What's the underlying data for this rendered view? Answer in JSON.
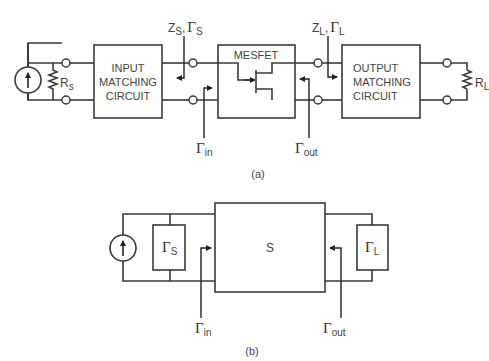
{
  "figure_a": {
    "caption": "(a)",
    "input_block": {
      "line1": "INPUT",
      "line2": "MATCHING",
      "line3": "CIRCUIT"
    },
    "device_block": {
      "label": "MESFET"
    },
    "output_block": {
      "line1": "OUTPUT",
      "line2": "MATCHING",
      "line3": "CIRCUIT"
    },
    "source_resistor": {
      "symbol": "R",
      "sub": "s"
    },
    "load_resistor": {
      "symbol": "R",
      "sub": "L"
    },
    "source_impedance_label": {
      "z": "Z",
      "z_sub": "S",
      "sep": ",",
      "gamma": "Γ",
      "gamma_sub": "S"
    },
    "load_impedance_label": {
      "z": "Z",
      "z_sub": "L",
      "sep": ",",
      "gamma": "Γ",
      "gamma_sub": "L"
    },
    "gamma_in": {
      "gamma": "Γ",
      "sub": "in"
    },
    "gamma_out": {
      "gamma": "Γ",
      "sub": "out"
    }
  },
  "figure_b": {
    "caption": "(b)",
    "s_block": {
      "label": "S"
    },
    "gamma_s_block": {
      "gamma": "Γ",
      "sub": "S"
    },
    "gamma_l_block": {
      "gamma": "Γ",
      "sub": "L"
    },
    "gamma_in": {
      "gamma": "Γ",
      "sub": "in"
    },
    "gamma_out": {
      "gamma": "Γ",
      "sub": "out"
    }
  },
  "colors": {
    "line": "#3a3a3a",
    "text": "#444444",
    "background": "#ffffff"
  }
}
